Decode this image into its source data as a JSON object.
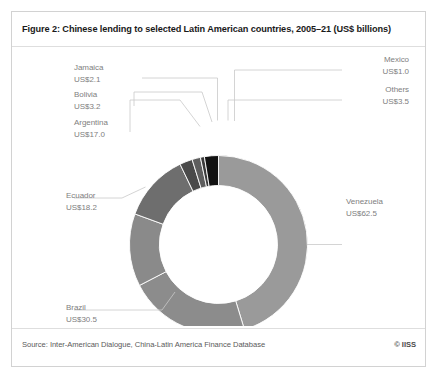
{
  "figure": {
    "title": "Figure 2: Chinese lending to selected Latin American countries, 2005–21 (US$ billions)",
    "source": "Source: Inter-American Dialogue, China-Latin America Finance Database",
    "copyright": "© IISS"
  },
  "labels": {
    "jamaica_name": "Jamaica",
    "jamaica_value": "US$2.1",
    "bolivia_name": "Bolivia",
    "bolivia_value": "US$3.2",
    "argentina_name": "Argentina",
    "argentina_value": "US$17.0",
    "ecuador_name": "Ecuador",
    "ecuador_value": "US$18.2",
    "brazil_name": "Brazil",
    "brazil_value": "US$30.5",
    "mexico_name": "Mexico",
    "mexico_value": "US$1.0",
    "others_name": "Others",
    "others_value": "US$3.5",
    "venezuela_name": "Venezuela",
    "venezuela_value": "US$62.5"
  },
  "chart_data": {
    "type": "pie",
    "variant": "donut",
    "title": "Figure 2: Chinese lending to selected Latin American countries, 2005–21 (US$ billions)",
    "unit": "US$ billions",
    "total": 137.0,
    "start_angle_deg": 0,
    "direction": "clockwise",
    "legend": "none-callout-labels",
    "grid": false,
    "categories": [
      "Venezuela",
      "Brazil",
      "Ecuador",
      "Argentina",
      "Bolivia",
      "Jamaica",
      "Mexico",
      "Others"
    ],
    "values": [
      62.5,
      30.5,
      18.2,
      17.0,
      3.2,
      2.1,
      1.0,
      3.5
    ],
    "slices": [
      {
        "name": "Venezuela",
        "value": 62.5,
        "label": "US$62.5",
        "color": "#9a9a9a",
        "percent": 45.6
      },
      {
        "name": "Brazil",
        "value": 30.5,
        "label": "US$30.5",
        "color": "#8c8c8c",
        "percent": 22.3
      },
      {
        "name": "Ecuador",
        "value": 18.2,
        "label": "US$18.2",
        "color": "#8a8a8a",
        "percent": 13.3
      },
      {
        "name": "Argentina",
        "value": 17.0,
        "label": "US$17.0",
        "color": "#6e6e6e",
        "percent": 12.4
      },
      {
        "name": "Bolivia",
        "value": 3.2,
        "label": "US$3.2",
        "color": "#4a4a4a",
        "percent": 2.3
      },
      {
        "name": "Jamaica",
        "value": 2.1,
        "label": "US$2.1",
        "color": "#5e5e5e",
        "percent": 1.5
      },
      {
        "name": "Mexico",
        "value": 1.0,
        "label": "US$1.0",
        "color": "#3a3a3a",
        "percent": 0.7
      },
      {
        "name": "Others",
        "value": 3.5,
        "label": "US$3.5",
        "color": "#111111",
        "percent": 2.6
      }
    ]
  }
}
